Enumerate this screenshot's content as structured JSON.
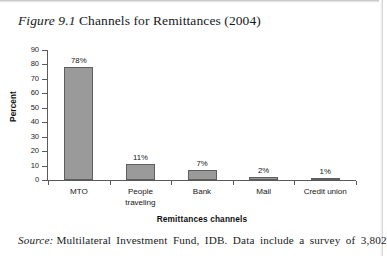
{
  "figure": {
    "label": "Figure 9.1",
    "title": "Channels for Remittances (2004)"
  },
  "source": {
    "label": "Source:",
    "text": "Multilateral Investment Fund, IDB. Data include a survey of 3,802"
  },
  "chart_data": {
    "type": "bar",
    "title": "Channels for Remittances (2004)",
    "categories": [
      "MTO",
      "People traveling",
      "Bank",
      "Mail",
      "Credit union"
    ],
    "values": [
      78,
      11,
      7,
      2,
      1
    ],
    "data_labels": [
      "78%",
      "11%",
      "7%",
      "2%",
      "1%"
    ],
    "xlabel": "Remittances channels",
    "ylabel": "Percent",
    "ylim": [
      0,
      90
    ],
    "ytick_labels": [
      "0",
      "10",
      "20",
      "30",
      "40",
      "50",
      "60",
      "70",
      "80",
      "90"
    ],
    "ytick_values": [
      0,
      10,
      20,
      30,
      40,
      50,
      60,
      70,
      80,
      90
    ],
    "grid": false,
    "legend": false,
    "bar_color": "#9a9a9a",
    "bar_edge_color": "#5e5e5e",
    "axis_color": "#5a5a5a"
  }
}
